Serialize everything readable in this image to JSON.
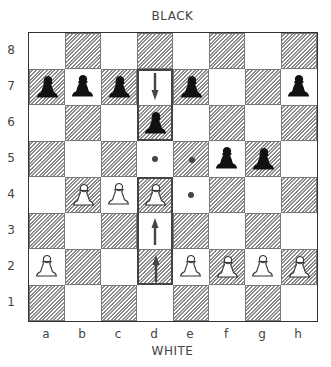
{
  "labels": {
    "top": "BLACK",
    "bottom": "WHITE"
  },
  "files": [
    "a",
    "b",
    "c",
    "d",
    "e",
    "f",
    "g",
    "h"
  ],
  "ranks": [
    "8",
    "7",
    "6",
    "5",
    "4",
    "3",
    "2",
    "1"
  ],
  "colors": {
    "border": "#333333",
    "hatch": "#8a8a8a",
    "black_piece": "#111111",
    "white_piece_outline": "#333333"
  },
  "pieces": [
    {
      "square": "a7",
      "type": "pawn",
      "color": "black"
    },
    {
      "square": "b7",
      "type": "pawn",
      "color": "black"
    },
    {
      "square": "c7",
      "type": "pawn",
      "color": "black"
    },
    {
      "square": "e7",
      "type": "pawn",
      "color": "black"
    },
    {
      "square": "h7",
      "type": "pawn",
      "color": "black"
    },
    {
      "square": "d6",
      "type": "pawn",
      "color": "black"
    },
    {
      "square": "f5",
      "type": "pawn",
      "color": "black"
    },
    {
      "square": "g5",
      "type": "pawn",
      "color": "black"
    },
    {
      "square": "b4",
      "type": "pawn",
      "color": "white"
    },
    {
      "square": "c4",
      "type": "pawn",
      "color": "white"
    },
    {
      "square": "d4",
      "type": "pawn",
      "color": "white"
    },
    {
      "square": "a2",
      "type": "pawn",
      "color": "white"
    },
    {
      "square": "e2",
      "type": "pawn",
      "color": "white"
    },
    {
      "square": "f2",
      "type": "pawn",
      "color": "white"
    },
    {
      "square": "g2",
      "type": "pawn",
      "color": "white"
    },
    {
      "square": "h2",
      "type": "pawn",
      "color": "white"
    }
  ],
  "markers": [
    {
      "square": "d5",
      "type": "dot"
    },
    {
      "square": "e5",
      "type": "dot"
    },
    {
      "square": "e4",
      "type": "dot"
    }
  ],
  "arrows": [
    {
      "square": "d7",
      "direction": "down"
    },
    {
      "square": "d3",
      "direction": "up"
    },
    {
      "square": "d2",
      "direction": "up"
    }
  ],
  "highlight_boxes": [
    {
      "from": "d7",
      "to": "d6"
    },
    {
      "from": "d4",
      "to": "d2"
    }
  ]
}
